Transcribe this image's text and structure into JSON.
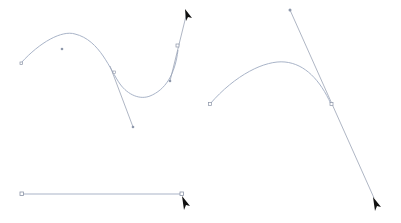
{
  "diagram": {
    "colors": {
      "path": "#a9b4c8",
      "handle": "#8e98ab",
      "anchor_stroke": "#8a93a6",
      "cursor": "#111111",
      "background": "#ffffff"
    },
    "panels": [
      {
        "id": "s-curve",
        "description": "S-shaped curve with direction handles, cursor dragging a handle"
      },
      {
        "id": "arc-curve",
        "description": "Arc curve with long direction line, cursor dragging handle end"
      },
      {
        "id": "straight-segment",
        "description": "Straight line segment between two anchor points, cursor at end point"
      }
    ],
    "icons": [
      "pen-arrow-cursor",
      "pen-arrow-cursor",
      "pen-arrow-cursor"
    ]
  }
}
